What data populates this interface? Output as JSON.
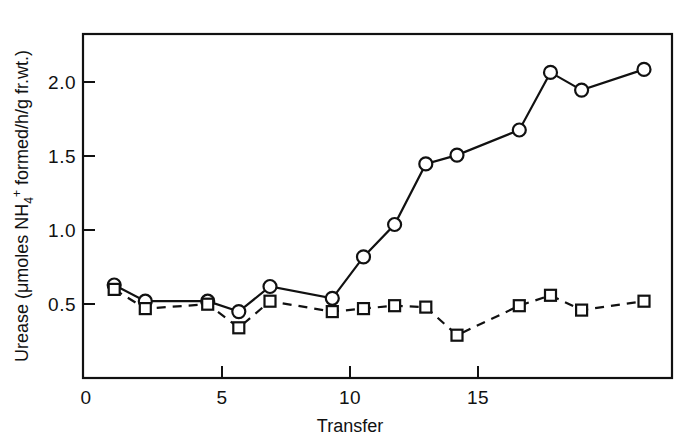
{
  "chart_data": {
    "type": "line",
    "title": "",
    "xlabel": "Transfer",
    "ylabel": "Urease (μmoles NH4+ formed/h/g fr.wt.)",
    "ylabel_parts": {
      "prefix": "Urease (μmoles NH",
      "subscript": "4",
      "superscript": "+",
      "suffix": " formed/h/g fr.wt.)"
    },
    "xlim": [
      0,
      18.9
    ],
    "ylim": [
      0,
      2.33
    ],
    "xticks": [
      0,
      5,
      10,
      15
    ],
    "xtick_labels": [
      "0",
      "5",
      "10",
      "15"
    ],
    "yticks": [
      0.5,
      1.0,
      1.5,
      2.0
    ],
    "ytick_labels": [
      "0.5",
      "1.0",
      "1.5",
      "2.0"
    ],
    "y_zero_label": "0",
    "grid": false,
    "legend": "none",
    "frame": "box",
    "x": [
      1,
      2,
      4,
      5,
      6,
      8,
      9,
      10,
      11,
      12,
      14,
      15,
      16,
      18
    ],
    "series": [
      {
        "name": "solid-circles",
        "marker": "circle",
        "linestyle": "solid",
        "color": "#111111",
        "values": [
          0.63,
          0.52,
          0.52,
          0.45,
          0.62,
          0.54,
          0.82,
          1.04,
          1.45,
          1.51,
          1.68,
          2.07,
          1.95,
          2.09
        ]
      },
      {
        "name": "dashed-squares",
        "marker": "square",
        "linestyle": "dashed",
        "color": "#111111",
        "values": [
          0.6,
          0.47,
          0.5,
          0.34,
          0.52,
          0.45,
          0.47,
          0.49,
          0.48,
          0.29,
          0.49,
          0.56,
          0.46,
          0.52
        ]
      }
    ]
  }
}
